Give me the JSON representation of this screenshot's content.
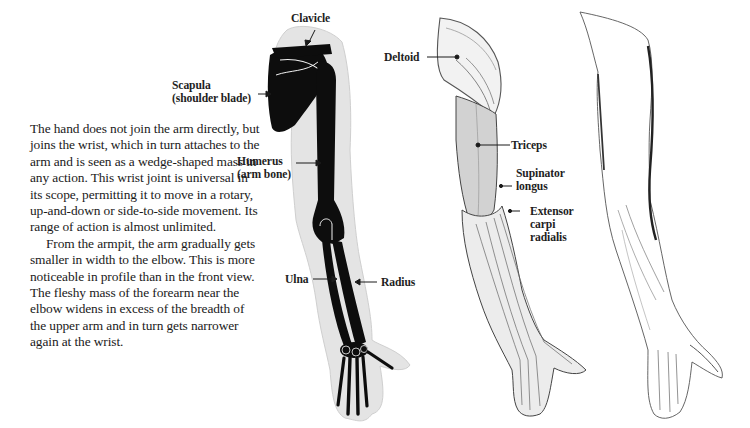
{
  "page": {
    "paragraphs": [
      "The hand does not join the arm directly, but joins the wrist, which in turn attaches to the arm and is seen as a wedge-shaped mass in any action. This wrist joint is universal in its scope, permitting it to move in a rotary, up-and-down or side-to-side movement. Its range of action is almost unlimited.",
      "From the armpit, the arm gradually gets smaller in width to the elbow. This is more noticeable in profile than in the front view. The fleshy mass of the forearm near the elbow widens in excess of the breadth of the upper arm and in turn gets narrower again at the wrist."
    ]
  },
  "figures": {
    "skeleton": {
      "labels": {
        "clavicle": "Clavicle",
        "scapula_line1": "Scapula",
        "scapula_line2": "(shoulder blade)",
        "humerus_line1": "Humerus",
        "humerus_line2": "(arm bone)",
        "ulna": "Ulna",
        "radius": "Radius"
      }
    },
    "muscles": {
      "labels": {
        "deltoid": "Deltoid",
        "triceps": "Triceps",
        "supinator_line1": "Supinator",
        "supinator_line2": "longus",
        "extensor_line1": "Extensor",
        "extensor_line2": "carpi",
        "extensor_line3": "radialis"
      }
    },
    "surface": {}
  },
  "colors": {
    "text": "#1a1a1a",
    "bone": "#0d0d0d",
    "flesh_outline": "#d9d9d9",
    "muscle_shade": "#c8c8c8"
  }
}
